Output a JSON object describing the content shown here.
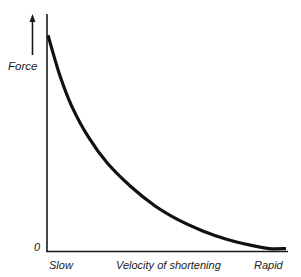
{
  "chart_data": {
    "type": "line",
    "title": "",
    "xlabel": "Velocity of shortening",
    "ylabel": "Force",
    "x_tick_labels": {
      "left": "Slow",
      "right": "Rapid"
    },
    "y_tick_labels": [
      "0"
    ],
    "xlim": [
      0,
      1
    ],
    "ylim": [
      0,
      1
    ],
    "grid": false,
    "legend": null,
    "series": [
      {
        "name": "Force-velocity curve",
        "x": [
          0.0,
          0.05,
          0.1,
          0.17,
          0.25,
          0.35,
          0.45,
          0.55,
          0.65,
          0.75,
          0.85,
          0.93,
          1.0
        ],
        "y": [
          0.91,
          0.74,
          0.61,
          0.48,
          0.37,
          0.27,
          0.19,
          0.13,
          0.085,
          0.05,
          0.025,
          0.01,
          0.01
        ]
      }
    ],
    "color": "#111111"
  },
  "labels": {
    "y_axis": "Force",
    "zero": "0",
    "x_left": "Slow",
    "x_center": "Velocity of shortening",
    "x_right": "Rapid"
  }
}
